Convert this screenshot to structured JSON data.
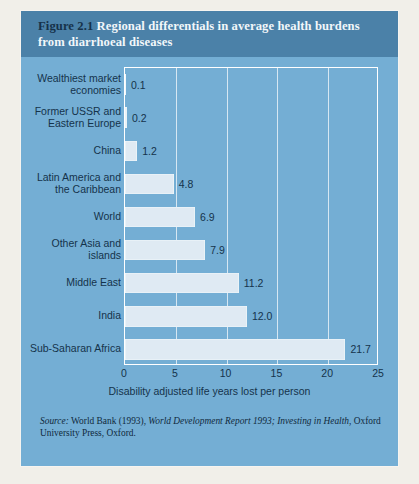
{
  "figure": {
    "number": "Figure 2.1",
    "title": "Regional differentials in average health burdens from diarrhoeal diseases"
  },
  "source": {
    "label": "Source:",
    "text_1": " World Bank (1993), ",
    "italic": "World Development Report 1993; Investing in Health",
    "text_2": ", Oxford University Press, Oxford."
  },
  "chart_data": {
    "type": "bar",
    "orientation": "horizontal",
    "title": "Regional differentials in average health burdens from diarrhoeal diseases",
    "xlabel": "Disability adjusted life years lost per person",
    "ylabel": "",
    "xlim": [
      0,
      25
    ],
    "xticks": [
      0,
      5,
      10,
      15,
      20,
      25
    ],
    "grid": true,
    "legend": false,
    "categories": [
      "Wealthiest market economies",
      "Former USSR and Eastern Europe",
      "China",
      "Latin America and the Caribbean",
      "World",
      "Other Asia and islands",
      "Middle East",
      "India",
      "Sub-Saharan Africa"
    ],
    "values": [
      0.1,
      0.2,
      1.2,
      4.8,
      6.9,
      7.9,
      11.2,
      12.0,
      21.7
    ],
    "value_labels": [
      "0.1",
      "0.2",
      "1.2",
      "4.8",
      "6.9",
      "7.9",
      "11.2",
      "12.0",
      "21.7"
    ]
  },
  "colors": {
    "card_background": "#74aed4",
    "header_background": "#4b81a8",
    "bar_fill": "#dfeaf3",
    "text_dark": "#14334b",
    "grid": "#e8f1f7",
    "page": "#f1efe9"
  }
}
